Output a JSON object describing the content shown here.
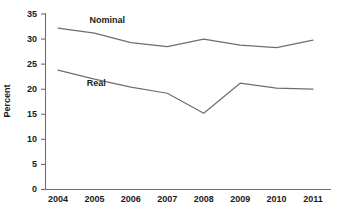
{
  "chart_data": {
    "type": "line",
    "title": "",
    "subtitle": "",
    "xlabel": "",
    "ylabel": "Percent",
    "categories": [
      "2004",
      "2005",
      "2006",
      "2007",
      "2008",
      "2009",
      "2010",
      "2011"
    ],
    "x": [
      2004,
      2005,
      2006,
      2007,
      2008,
      2009,
      2010,
      2011
    ],
    "ylim": [
      0,
      35
    ],
    "yticks": [
      0,
      5,
      10,
      15,
      20,
      25,
      30,
      35
    ],
    "ytick_labels": [
      "0",
      "5",
      "10",
      "15",
      "20",
      "25",
      "30",
      "35"
    ],
    "grid": false,
    "legend_position": "inline-annotation",
    "series": [
      {
        "name": "Nominal",
        "color": "#6e6e6e",
        "values": [
          32.2,
          31.2,
          29.3,
          28.5,
          30.0,
          28.8,
          28.3,
          29.8
        ],
        "label_text": "Nominal"
      },
      {
        "name": "Real",
        "color": "#6e6e6e",
        "values": [
          23.8,
          22.0,
          20.4,
          19.2,
          15.2,
          21.2,
          20.2,
          20.0
        ],
        "label_text": "Real"
      }
    ],
    "annotations": [
      {
        "text": "Nominal",
        "x": 2005.35,
        "y": 33.2
      },
      {
        "text": "Real",
        "x": 2005.05,
        "y": 20.6
      }
    ],
    "colors": {
      "axis": "#6e6e6e",
      "text": "#1a1a1a",
      "line_nominal": "#6e6e6e",
      "line_real": "#6e6e6e",
      "background": "#ffffff"
    }
  }
}
